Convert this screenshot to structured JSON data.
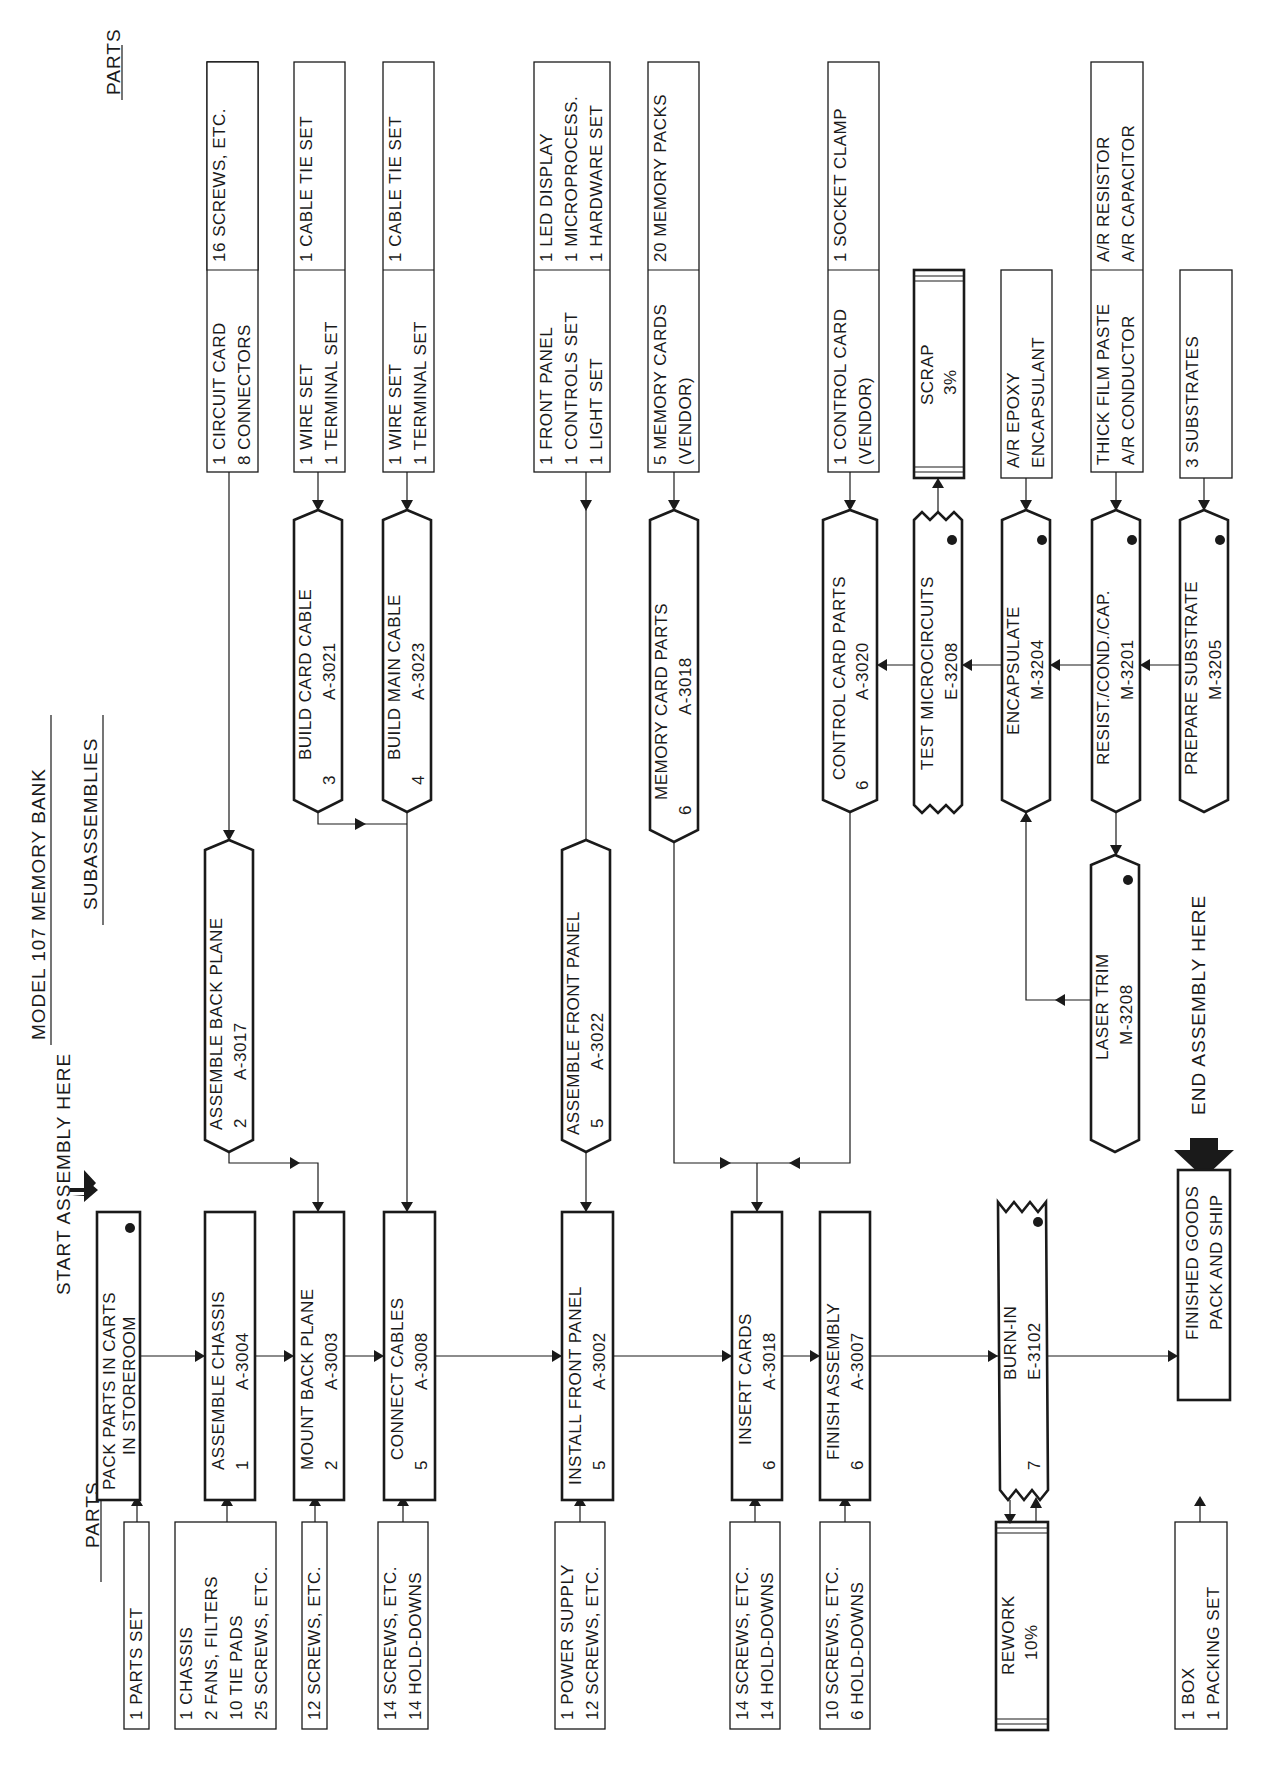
{
  "title": "MODEL 107 MEMORY BANK",
  "headers": {
    "parts_left": "PARTS",
    "subassemblies": "SUBASSEMBLIES",
    "parts_right": "PARTS",
    "start": "START ASSEMBLY HERE",
    "end": "END ASSEMBLY HERE"
  },
  "main_line": [
    {
      "id": "pack",
      "line1": "PACK PARTS IN CARTS",
      "line2": "IN STOREROOM",
      "station": "",
      "code": "",
      "inspection": true
    },
    {
      "id": "chassis",
      "line1": "ASSEMBLE CHASSIS",
      "station": "1",
      "code": "A-3004"
    },
    {
      "id": "backplane",
      "line1": "MOUNT BACK PLANE",
      "station": "2",
      "code": "A-3003"
    },
    {
      "id": "cables",
      "line1": "CONNECT CABLES",
      "station": "5",
      "code": "A-3008"
    },
    {
      "id": "frontpanel",
      "line1": "INSTALL FRONT PANEL",
      "station": "5",
      "code": "A-3002"
    },
    {
      "id": "cards",
      "line1": "INSERT CARDS",
      "station": "6",
      "code": "A-3018"
    },
    {
      "id": "finish",
      "line1": "FINISH ASSEMBLY",
      "station": "6",
      "code": "A-3007"
    },
    {
      "id": "burnin",
      "line1": "BURN-IN",
      "station": "7",
      "code": "E-3102",
      "inspection": true
    },
    {
      "id": "ship",
      "line1": "FINISHED GOODS",
      "line2": "PACK AND SHIP"
    }
  ],
  "parts_left": [
    {
      "lines": [
        "1   PARTS SET"
      ]
    },
    {
      "lines": [
        "1   CHASSIS",
        "2   FANS, FILTERS",
        "10 TIE PADS",
        "25 SCREWS, ETC."
      ]
    },
    {
      "lines": [
        "12 SCREWS, ETC."
      ]
    },
    {
      "lines": [
        "14 SCREWS, ETC.",
        "14 HOLD-DOWNS"
      ]
    },
    {
      "lines": [
        "1   POWER SUPPLY",
        "12 SCREWS, ETC."
      ]
    },
    {
      "lines": [
        "14 SCREWS, ETC.",
        "14 HOLD-DOWNS"
      ]
    },
    {
      "lines": [
        "10 SCREWS, ETC.",
        "6   HOLD-DOWNS"
      ]
    },
    {
      "lines": [
        "REWORK",
        "10%"
      ],
      "type": "storage"
    },
    {
      "lines": [
        "1   BOX",
        "1   PACKING SET"
      ]
    }
  ],
  "subassemblies": [
    {
      "id": "asm_backplane",
      "line1": "ASSEMBLE BACK PLANE",
      "station": "2",
      "code": "A-3017"
    },
    {
      "id": "card_cable",
      "line1": "BUILD CARD CABLE",
      "station": "3",
      "code": "A-3021"
    },
    {
      "id": "main_cable",
      "line1": "BUILD MAIN CABLE",
      "station": "4",
      "code": "A-3023"
    },
    {
      "id": "asm_frontpanel",
      "line1": "ASSEMBLE FRONT PANEL",
      "station": "5",
      "code": "A-3022"
    },
    {
      "id": "memcard",
      "line1": "MEMORY CARD PARTS",
      "station": "6",
      "code": "A-3018"
    },
    {
      "id": "ctrlcard",
      "line1": "CONTROL CARD PARTS",
      "station": "6",
      "code": "A-3020"
    },
    {
      "id": "testmicro",
      "line1": "TEST MICROCIRCUITS",
      "station": "",
      "code": "E-3208",
      "inspection": true
    },
    {
      "id": "encap",
      "line1": "ENCAPSULATE",
      "station": "",
      "code": "M-3204",
      "inspection": true
    },
    {
      "id": "resist",
      "line1": "RESIST./COND./CAP.",
      "station": "",
      "code": "M-3201",
      "inspection": true
    },
    {
      "id": "substrate",
      "line1": "PREPARE SUBSTRATE",
      "station": "",
      "code": "M-3205",
      "inspection": true
    },
    {
      "id": "laser",
      "line1": "LASER TRIM",
      "station": "",
      "code": "M-3208",
      "inspection": true
    },
    {
      "id": "scrap",
      "line1": "SCRAP",
      "line2": "3%",
      "type": "storage"
    }
  ],
  "parts_right": [
    {
      "left": [
        "1   CIRCUIT CARD",
        "8   CONNECTORS"
      ],
      "right": [
        "16 SCREWS, ETC."
      ]
    },
    {
      "left": [
        "1   WIRE SET",
        "1   TERMINAL SET"
      ],
      "right": [
        "1   CABLE TIE SET"
      ]
    },
    {
      "left": [
        "1   WIRE SET",
        "1   TERMINAL SET"
      ],
      "right": [
        "1   CABLE TIE SET"
      ]
    },
    {
      "left": [
        "1   FRONT PANEL",
        "1   CONTROLS SET",
        "1   LIGHT SET"
      ],
      "right": [
        "1   LED DISPLAY",
        "1   MICROPROCESS.",
        "1   HARDWARE SET"
      ]
    },
    {
      "left": [
        "5   MEMORY CARDS",
        "     (VENDOR)"
      ],
      "right": [
        "20 MEMORY PACKS"
      ]
    },
    {
      "left": [
        "1   CONTROL CARD",
        "     (VENDOR)"
      ],
      "right": [
        "1   SOCKET CLAMP"
      ]
    },
    {
      "left": [
        "A/R EPOXY",
        "      ENCAPSULANT"
      ]
    },
    {
      "left": [
        "THICK FILM PASTE",
        "A/R CONDUCTOR"
      ],
      "right": [
        "A/R RESISTOR",
        "A/R CAPACITOR"
      ]
    },
    {
      "left": [
        "3   SUBSTRATES"
      ]
    }
  ]
}
